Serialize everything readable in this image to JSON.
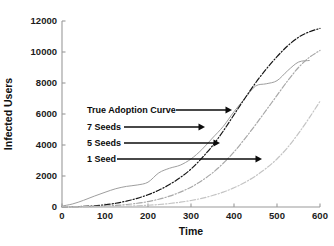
{
  "chart_data": {
    "type": "line",
    "title": "",
    "xlabel": "Time",
    "ylabel": "Infected Users",
    "xlim": [
      0,
      600
    ],
    "ylim": [
      0,
      12000
    ],
    "grid": false,
    "legend_position": "inline-annotations",
    "xticks": [
      0,
      100,
      200,
      300,
      400,
      500,
      600
    ],
    "xtick_labels": [
      "0",
      "100",
      "200",
      "300",
      "400",
      "500",
      "600"
    ],
    "yticks": [
      0,
      2000,
      4000,
      6000,
      8000,
      10000,
      12000
    ],
    "ytick_labels": [
      "0",
      "2000",
      "4000",
      "6000",
      "8000",
      "10000",
      "12000"
    ],
    "x": [
      0,
      25,
      50,
      75,
      100,
      125,
      150,
      175,
      200,
      225,
      250,
      275,
      300,
      325,
      350,
      375,
      400,
      425,
      450,
      475,
      500,
      525,
      550,
      575,
      600
    ],
    "series": [
      {
        "name": "True Adoption Curve",
        "style": "solid",
        "color": "#9e9e9e",
        "values": [
          60,
          200,
          430,
          700,
          950,
          1180,
          1330,
          1420,
          1600,
          2200,
          2500,
          2700,
          3100,
          3700,
          4450,
          5200,
          6150,
          7000,
          7800,
          7950,
          8150,
          8800,
          9350,
          9450,
          null
        ]
      },
      {
        "name": "7 Seeds",
        "style": "dashdot",
        "color": "#161616",
        "values": [
          10,
          20,
          40,
          75,
          140,
          240,
          380,
          560,
          790,
          1080,
          1450,
          1900,
          2450,
          3150,
          3950,
          4900,
          5950,
          7000,
          8000,
          8900,
          9700,
          10400,
          10950,
          11300,
          11520
        ]
      },
      {
        "name": "5 Seeds",
        "style": "dashdot",
        "color": "#a8a8a8",
        "values": [
          5,
          10,
          20,
          35,
          60,
          100,
          160,
          240,
          350,
          500,
          700,
          960,
          1280,
          1700,
          2200,
          2820,
          3550,
          4400,
          5300,
          6250,
          7200,
          8150,
          9000,
          9650,
          10100
        ]
      },
      {
        "name": "1 Seed",
        "style": "dashdot",
        "color": "#c4c4c4",
        "values": [
          2,
          4,
          7,
          12,
          20,
          32,
          50,
          76,
          112,
          160,
          225,
          310,
          420,
          560,
          740,
          960,
          1240,
          1580,
          2000,
          2500,
          3100,
          3850,
          4750,
          5750,
          6820
        ]
      }
    ],
    "annotations": [
      {
        "label": "True Adoption Curve",
        "label_x_px": 87,
        "label_y_px": 113,
        "arrow_from_px": [
          176,
          110
        ],
        "arrow_to_px": [
          232,
          110
        ]
      },
      {
        "label": "7 Seeds",
        "label_x_px": 87,
        "label_y_px": 130,
        "arrow_from_px": [
          124,
          127
        ],
        "arrow_to_px": [
          205,
          127
        ]
      },
      {
        "label": "5 Seeds",
        "label_x_px": 87,
        "label_y_px": 146,
        "arrow_from_px": [
          124,
          143
        ],
        "arrow_to_px": [
          220,
          143
        ]
      },
      {
        "label": "1 Seed",
        "label_x_px": 87,
        "label_y_px": 162,
        "arrow_from_px": [
          117,
          159
        ],
        "arrow_to_px": [
          262,
          159
        ]
      }
    ]
  },
  "plot_geometry": {
    "left_px": 62,
    "right_px": 320,
    "top_px": 21,
    "bottom_px": 207
  },
  "colors": {
    "axis": "#9a9a9a",
    "text": "#111111",
    "background": "#ffffff"
  }
}
